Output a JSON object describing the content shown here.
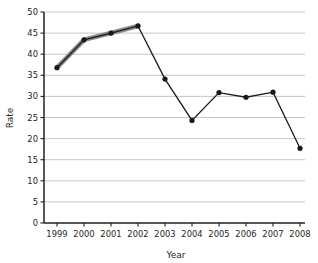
{
  "chart_data": {
    "type": "line",
    "title": "",
    "xlabel": "Year",
    "ylabel": "Rate",
    "categories": [
      "1999",
      "2000",
      "2001",
      "2002",
      "2003",
      "2004",
      "2005",
      "2006",
      "2007",
      "2008"
    ],
    "values": [
      36.8,
      43.4,
      45.0,
      46.7,
      34.1,
      24.3,
      30.9,
      29.8,
      31.0,
      17.7
    ],
    "series": [
      {
        "name": "Rate",
        "values": [
          36.8,
          43.4,
          45.0,
          46.7,
          34.1,
          24.3,
          30.9,
          29.8,
          31.0,
          17.7
        ]
      }
    ],
    "highlight": {
      "description": "thick gray overlay on segments 1999-2002",
      "from_category": "1999",
      "to_category": "2002",
      "color": "#8c8c8c"
    },
    "ylim": [
      0,
      50
    ],
    "ytick_labels": [
      "0",
      "5",
      "10",
      "15",
      "20",
      "25",
      "30",
      "35",
      "40",
      "45",
      "50"
    ],
    "ytick_values": [
      0,
      5,
      10,
      15,
      20,
      25,
      30,
      35,
      40,
      45,
      50
    ],
    "xtick_labels": [
      "1999",
      "2000",
      "2001",
      "2002",
      "2003",
      "2004",
      "2005",
      "2006",
      "2007",
      "2008"
    ],
    "grid": true,
    "legend": false,
    "marker": "circle",
    "line_color": "#191919",
    "grid_color": "#b9b9b9",
    "axis_color": "#231f20",
    "background": "#ffffff"
  }
}
